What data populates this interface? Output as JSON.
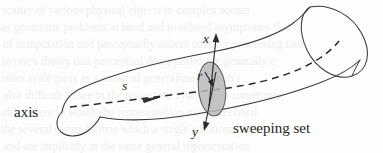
{
  "figure": {
    "caption_labels": {
      "axis": "axis",
      "sweeping_set": "sweeping set",
      "x_axis": "x",
      "y_axis": "y",
      "radius": "r",
      "arclength": "s"
    },
    "colors": {
      "ink": "#262626",
      "outline": "#3a3a3a",
      "sweeping_set_fill": "#b9b9b9",
      "sweeping_set_stroke": "#555555",
      "dashed_axis": "#2b2b2b",
      "background": "#fdfdfc",
      "bleed_text": "#4a4a4a"
    }
  },
  "bleed_through_text": {
    "line1": "scatter of various physical objects in complex scenes",
    "line2": "as geometric problems at hand and to related asymptotics that o",
    "line3": "of computation and perceptually salient cues for processing task",
    "line4": "to one's theory that perceptual descriptions are generally c",
    "line5": "other scale parts as a union of generalization with r",
    "line6": "also difficult to see in the respective systems, so sometimes",
    "line7": "able extent to which the representation may be refined",
    "line8": "the several computations which a single additional layer of",
    "line9": "and are implicitly in the same general representation"
  }
}
